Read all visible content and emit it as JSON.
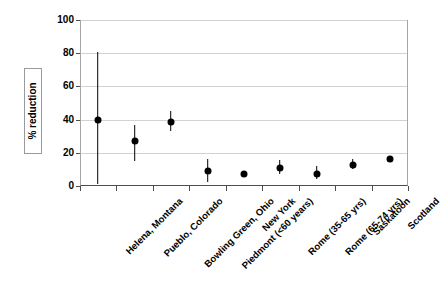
{
  "chart_data": {
    "type": "scatter",
    "title": "",
    "subtitle": "",
    "xlabel": "",
    "ylabel": "% reduction",
    "ylim": [
      0,
      100
    ],
    "yticks": [
      0,
      20,
      40,
      60,
      80,
      100
    ],
    "ytick_labels": [
      "0",
      "20",
      "40",
      "60",
      "80",
      "100"
    ],
    "grid": "horizontal",
    "legend": "none",
    "marker": "filled-circle",
    "errorbar_style": "plain-vertical-line-no-caps",
    "categories": [
      "Helena, Montana",
      "Pueblo, Colorado",
      "Bowling Green, Ohio",
      "Piedmont (<60 years)",
      "New York",
      "Rome (35-65 yrs)",
      "Rome (65-74 yrs)",
      "Saskatoon",
      "Scotland"
    ],
    "values": [
      40,
      27,
      38.5,
      9,
      7.5,
      11,
      7.5,
      12.5,
      16.5
    ],
    "ci_low": [
      1,
      15,
      33,
      2.5,
      null,
      7,
      4,
      10,
      null
    ],
    "ci_high": [
      81,
      37,
      45,
      16,
      null,
      15.5,
      12,
      16,
      null
    ],
    "points": [
      {
        "category": "Helena, Montana",
        "value": 40,
        "low": 1,
        "high": 81
      },
      {
        "category": "Pueblo, Colorado",
        "value": 27,
        "low": 15,
        "high": 37
      },
      {
        "category": "Bowling Green, Ohio",
        "value": 38.5,
        "low": 33,
        "high": 45
      },
      {
        "category": "Piedmont (<60 years)",
        "value": 9,
        "low": 2.5,
        "high": 16
      },
      {
        "category": "New York",
        "value": 7.5,
        "low": null,
        "high": null
      },
      {
        "category": "Rome (35-65 yrs)",
        "value": 11,
        "low": 7,
        "high": 15.5
      },
      {
        "category": "Rome (65-74 yrs)",
        "value": 7.5,
        "low": 4,
        "high": 12
      },
      {
        "category": "Saskatoon",
        "value": 12.5,
        "low": 10,
        "high": 16
      },
      {
        "category": "Scotland",
        "value": 16.5,
        "low": null,
        "high": null
      }
    ],
    "colors": {
      "marker": "#000000",
      "errorbar": "#000000",
      "gridline": "#d2d2d2",
      "axis": "#4d4d4d",
      "frame": "#a6a6a6",
      "background": "#ffffff",
      "text": "#000000"
    }
  }
}
